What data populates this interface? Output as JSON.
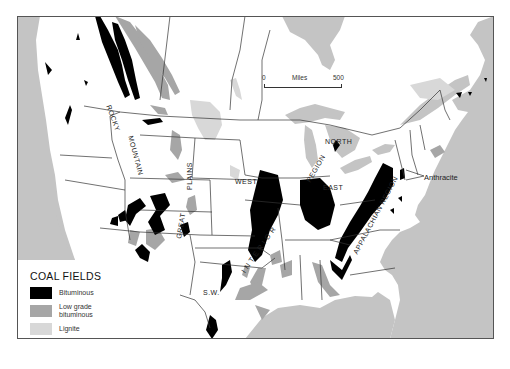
{
  "map": {
    "title": "Coal fields of the United States",
    "colors": {
      "water": "#c4c4c4",
      "land": "#ffffff",
      "border": "#333333",
      "bituminous": "#000000",
      "low_grade_bituminous": "#a6a6a6",
      "lignite": "#d8d8d8"
    },
    "region_labels": {
      "rocky_mountain_1": "ROCKY",
      "rocky_mountain_2": "MOUNTAIN",
      "great_plains_1": "GREAT",
      "great_plains_2": "PLAINS",
      "interior_west": "WEST",
      "interior_east": "EAST",
      "interior_north": "NORTH",
      "interior_region": "REGION",
      "interior": "I N T E R I O R",
      "southwest": "S.W.",
      "appalachian": "APPALACHIAN REGION",
      "anthracite": "Anthracite"
    },
    "scale_bar": {
      "start": "0",
      "unit": "Miles",
      "end": "500"
    }
  },
  "legend": {
    "title": "COAL FIELDS",
    "items": [
      {
        "label": "Bituminous",
        "color": "#000000"
      },
      {
        "label_line1": "Low grade",
        "label_line2": "bituminous",
        "color": "#a6a6a6"
      },
      {
        "label": "Lignite",
        "color": "#d8d8d8"
      }
    ]
  }
}
